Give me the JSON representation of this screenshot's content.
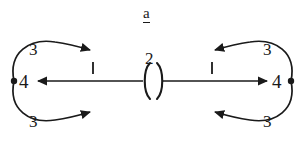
{
  "figure": {
    "title": "a",
    "title_underlined": true,
    "background_color": "#ffffff",
    "ink_color": "#1a1a1a",
    "width": 305,
    "height": 144
  },
  "nodes": [
    {
      "id": "left",
      "label": "4",
      "shape": "filled-dot",
      "x": 14,
      "y": 81
    },
    {
      "id": "right",
      "label": "4",
      "shape": "filled-dot",
      "x": 291,
      "y": 81
    }
  ],
  "edges": [
    {
      "id": "top-left-loop",
      "label": "3",
      "style": "curved",
      "direction": "rightward",
      "arrowhead": "right",
      "side": "left",
      "position": "top"
    },
    {
      "id": "bottom-left-loop",
      "label": "3",
      "style": "curved",
      "direction": "rightward",
      "arrowhead": "right",
      "side": "left",
      "position": "bottom"
    },
    {
      "id": "top-right-loop",
      "label": "3",
      "style": "curved",
      "direction": "leftward",
      "arrowhead": "left",
      "side": "right",
      "position": "top"
    },
    {
      "id": "bottom-right-loop",
      "label": "3",
      "style": "curved",
      "direction": "leftward",
      "arrowhead": "left",
      "side": "right",
      "position": "bottom"
    },
    {
      "id": "center-left-segment",
      "label": "1",
      "style": "straight",
      "direction": "leftward",
      "arrowhead": "left",
      "tick": true
    },
    {
      "id": "center-right-segment",
      "label": "1",
      "style": "straight",
      "direction": "rightward",
      "arrowhead": "right",
      "tick": true
    }
  ],
  "center": {
    "label": "2",
    "glyph": "( )",
    "description": "paired arc brackets straddling the horizontal edge"
  },
  "tick_marks": [
    {
      "id": "left-tick",
      "x": 93,
      "label": "1"
    },
    {
      "id": "right-tick",
      "x": 212,
      "label": "1"
    }
  ]
}
